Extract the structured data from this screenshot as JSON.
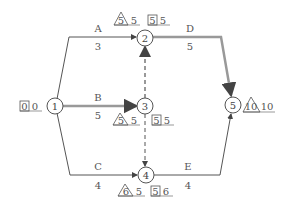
{
  "diagram": {
    "type": "activity-on-arrow network",
    "nodes": [
      {
        "id": "1",
        "label": "1"
      },
      {
        "id": "2",
        "label": "2"
      },
      {
        "id": "3",
        "label": "3"
      },
      {
        "id": "4",
        "label": "4"
      },
      {
        "id": "5",
        "label": "5"
      }
    ],
    "activities": [
      {
        "name": "A",
        "duration": "3",
        "from": "1",
        "to": "2",
        "critical": false
      },
      {
        "name": "B",
        "duration": "5",
        "from": "1",
        "to": "3",
        "critical": true
      },
      {
        "name": "C",
        "duration": "4",
        "from": "1",
        "to": "4",
        "critical": false
      },
      {
        "name": "D",
        "duration": "5",
        "from": "2",
        "to": "5",
        "critical": true
      },
      {
        "name": "E",
        "duration": "4",
        "from": "4",
        "to": "5",
        "critical": false
      }
    ],
    "dummies": [
      {
        "from": "3",
        "to": "2",
        "critical": true
      },
      {
        "from": "3",
        "to": "4",
        "critical": false
      }
    ],
    "node_times": {
      "1": {
        "box": [
          "0",
          "0"
        ]
      },
      "2": {
        "triangle": "5",
        "tri_after": "5",
        "box": [
          "5",
          "5"
        ]
      },
      "3": {
        "triangle": "5",
        "tri_after": "5",
        "box": [
          "5",
          "5"
        ]
      },
      "4": {
        "triangle": "6",
        "tri_after": "5",
        "box": [
          "5",
          "6"
        ]
      },
      "5": {
        "triangle": "10",
        "tri_after": "10"
      }
    },
    "colors": {
      "normal": "#555555",
      "critical": "#999999"
    }
  }
}
